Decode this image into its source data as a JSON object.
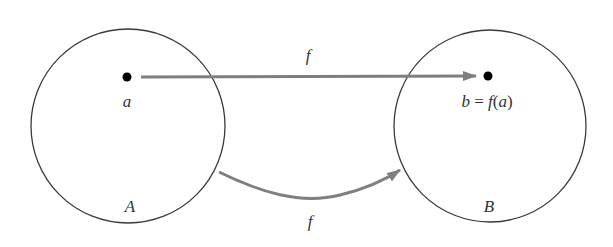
{
  "diagram": {
    "sets": [
      {
        "name": "A",
        "label": "A"
      },
      {
        "name": "B",
        "label": "B"
      }
    ],
    "points": [
      {
        "name": "a",
        "label": "a",
        "set": "A"
      },
      {
        "name": "b",
        "label_parts": [
          "b",
          " = ",
          "f",
          "(",
          "a",
          ")"
        ],
        "set": "B"
      }
    ],
    "arrows": [
      {
        "name": "element-map",
        "from": "a",
        "to": "b",
        "label": "f",
        "style": "straight"
      },
      {
        "name": "set-map",
        "from": "A",
        "to": "B",
        "label": "f",
        "style": "curved"
      }
    ],
    "colors": {
      "circle_stroke": "#3a3a3a",
      "arrow": "#7f7f7f",
      "point": "#000000",
      "text": "#333333"
    }
  }
}
